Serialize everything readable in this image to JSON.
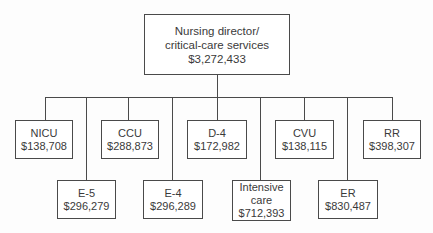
{
  "root": {
    "lines": [
      "Nursing director/",
      "critical-care services"
    ],
    "amount": "$3,272,433"
  },
  "units": [
    {
      "id": "nicu",
      "lines": [
        "NICU"
      ],
      "amount": "$138,708",
      "row": "upper"
    },
    {
      "id": "e5",
      "lines": [
        "E-5"
      ],
      "amount": "$296,279",
      "row": "lower"
    },
    {
      "id": "ccu",
      "lines": [
        "CCU"
      ],
      "amount": "$288,873",
      "row": "upper"
    },
    {
      "id": "e4",
      "lines": [
        "E-4"
      ],
      "amount": "$296,289",
      "row": "lower"
    },
    {
      "id": "d4",
      "lines": [
        "D-4"
      ],
      "amount": "$172,982",
      "row": "upper"
    },
    {
      "id": "intensive-care",
      "lines": [
        "Intensive",
        "care"
      ],
      "amount": "$712,393",
      "row": "lower"
    },
    {
      "id": "cvu",
      "lines": [
        "CVU"
      ],
      "amount": "$138,115",
      "row": "upper"
    },
    {
      "id": "er",
      "lines": [
        "ER"
      ],
      "amount": "$830,487",
      "row": "lower"
    },
    {
      "id": "rr",
      "lines": [
        "RR"
      ],
      "amount": "$398,307",
      "row": "upper"
    }
  ]
}
